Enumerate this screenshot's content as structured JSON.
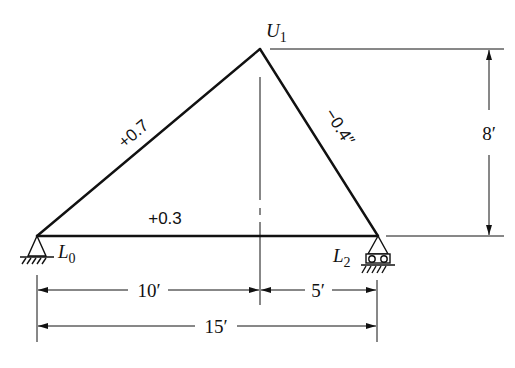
{
  "diagram": {
    "type": "truss",
    "joints": [
      {
        "id": "L0",
        "label_main": "L",
        "label_sub": "0",
        "support": "pin"
      },
      {
        "id": "U1",
        "label_main": "U",
        "label_sub": "1",
        "support": "none"
      },
      {
        "id": "L2",
        "label_main": "L",
        "label_sub": "2",
        "support": "roller"
      }
    ],
    "members": [
      {
        "from": "L0",
        "to": "U1",
        "label": "+0.7"
      },
      {
        "from": "U1",
        "to": "L2",
        "label": "−0.4″"
      },
      {
        "from": "L0",
        "to": "L2",
        "label": "+0.3"
      }
    ],
    "dimensions": {
      "height": "8′",
      "left_span": "10′",
      "right_span": "5′",
      "total_span": "15′"
    },
    "colors": {
      "line": "#111111",
      "background": "#ffffff"
    }
  }
}
